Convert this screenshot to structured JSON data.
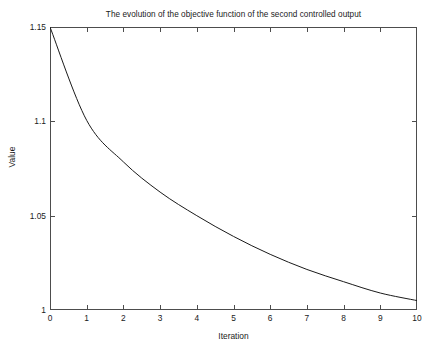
{
  "chart_data": {
    "type": "line",
    "title": "The evolution of the objective function of the second controlled output",
    "xlabel": "Iteration",
    "ylabel": "Value",
    "x": [
      0,
      1,
      2,
      3,
      4,
      5,
      6,
      7,
      8,
      9,
      10
    ],
    "values": [
      1.15,
      1.1005,
      1.0785,
      1.0625,
      1.05,
      1.039,
      1.0295,
      1.0215,
      1.015,
      1.009,
      1.005
    ],
    "series": [
      {
        "name": "objective",
        "values": [
          1.15,
          1.1005,
          1.0785,
          1.0625,
          1.05,
          1.039,
          1.0295,
          1.0215,
          1.015,
          1.009,
          1.005
        ]
      }
    ],
    "xlim": [
      0,
      10
    ],
    "ylim": [
      1,
      1.15
    ],
    "xticks": [
      0,
      1,
      2,
      3,
      4,
      5,
      6,
      7,
      8,
      9,
      10
    ],
    "xtick_labels": [
      "0",
      "1",
      "2",
      "3",
      "4",
      "5",
      "6",
      "7",
      "8",
      "9",
      "10"
    ],
    "yticks": [
      1,
      1.05,
      1.1,
      1.15
    ],
    "ytick_labels": [
      "1",
      "1.05",
      "1.1",
      "1.15"
    ],
    "grid": false,
    "legend": null,
    "line_color": "#1a1a1a",
    "background_color": "#ffffff",
    "axis_color": "#4d4d4d"
  }
}
